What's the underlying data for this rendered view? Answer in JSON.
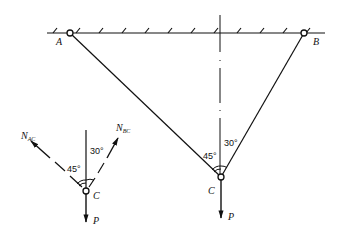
{
  "diagram": {
    "type": "two-bar truss with free-body diagram",
    "support": {
      "label_left": "A",
      "label_right": "B"
    },
    "joint_label": "C",
    "load_label": "P",
    "angles": {
      "left": "45°",
      "right": "30°"
    },
    "fbd": {
      "force_ac": {
        "main": "N",
        "sub": "AC"
      },
      "force_bc": {
        "main": "N",
        "sub": "BC"
      },
      "joint_label": "C",
      "load_label": "P",
      "angles": {
        "left": "45°",
        "right": "30°"
      }
    },
    "colors": {
      "line": "#111111",
      "background": "#ffffff"
    }
  }
}
